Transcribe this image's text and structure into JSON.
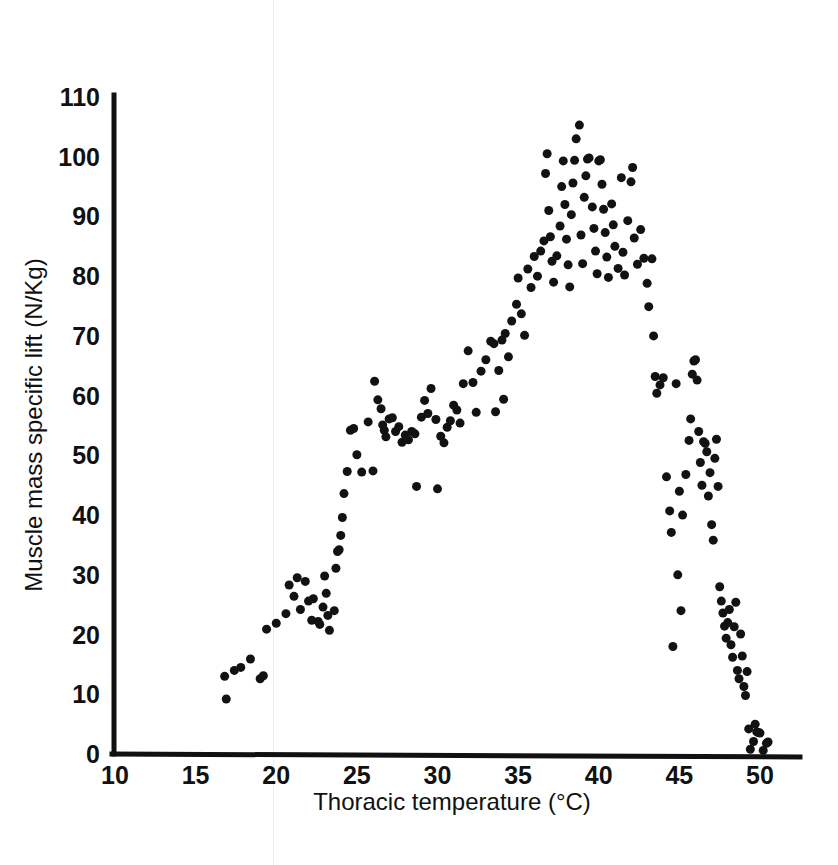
{
  "chart_data": {
    "type": "scatter",
    "title": "",
    "xlabel": "Thoracic temperature (°C)",
    "ylabel": "Muscle mass specific lift (N/Kg)",
    "xlim": [
      10,
      51.5
    ],
    "ylim": [
      0,
      110
    ],
    "xticks": [
      10,
      15,
      20,
      25,
      30,
      35,
      40,
      45,
      50
    ],
    "yticks": [
      0,
      10,
      20,
      30,
      40,
      50,
      60,
      70,
      80,
      90,
      100,
      110
    ],
    "xtick_labels": [
      "10",
      "15",
      "20",
      "25",
      "30",
      "35",
      "40",
      "45",
      "50"
    ],
    "ytick_labels": [
      "0",
      "10",
      "20",
      "30",
      "40",
      "50",
      "60",
      "70",
      "80",
      "90",
      "100",
      "110"
    ],
    "grid": false,
    "legend": null,
    "marker": {
      "shape": "circle",
      "color": "#121212",
      "size_px": 9
    },
    "series": [
      {
        "name": "Muscle mass specific lift vs thoracic temperature",
        "points": [
          [
            16.8,
            13.0
          ],
          [
            16.9,
            9.2
          ],
          [
            17.4,
            14.0
          ],
          [
            17.8,
            14.5
          ],
          [
            18.4,
            15.9
          ],
          [
            19.0,
            12.6
          ],
          [
            19.2,
            13.1
          ],
          [
            19.4,
            20.9
          ],
          [
            20.0,
            21.9
          ],
          [
            20.6,
            23.5
          ],
          [
            20.8,
            28.3
          ],
          [
            21.1,
            26.4
          ],
          [
            21.3,
            29.5
          ],
          [
            21.5,
            24.2
          ],
          [
            21.8,
            28.9
          ],
          [
            22.0,
            25.6
          ],
          [
            22.2,
            22.4
          ],
          [
            22.3,
            26.0
          ],
          [
            22.6,
            22.2
          ],
          [
            22.7,
            21.7
          ],
          [
            22.9,
            24.6
          ],
          [
            23.0,
            29.8
          ],
          [
            23.1,
            26.9
          ],
          [
            23.2,
            23.2
          ],
          [
            23.3,
            20.7
          ],
          [
            23.6,
            24.0
          ],
          [
            23.7,
            31.1
          ],
          [
            23.8,
            33.9
          ],
          [
            23.9,
            34.2
          ],
          [
            24.0,
            36.6
          ],
          [
            24.1,
            39.6
          ],
          [
            24.2,
            43.6
          ],
          [
            24.4,
            47.3
          ],
          [
            24.6,
            54.2
          ],
          [
            24.8,
            54.5
          ],
          [
            25.3,
            47.2
          ],
          [
            25.7,
            55.6
          ],
          [
            26.1,
            62.4
          ],
          [
            26.3,
            59.3
          ],
          [
            26.5,
            57.8
          ],
          [
            26.6,
            55.1
          ],
          [
            26.7,
            54.2
          ],
          [
            26.8,
            53.1
          ],
          [
            27.0,
            56.1
          ],
          [
            27.2,
            56.3
          ],
          [
            27.4,
            54.0
          ],
          [
            27.6,
            54.8
          ],
          [
            27.8,
            52.2
          ],
          [
            28.0,
            53.4
          ],
          [
            28.2,
            52.6
          ],
          [
            28.4,
            54.0
          ],
          [
            28.6,
            53.6
          ],
          [
            28.7,
            44.8
          ],
          [
            29.0,
            56.4
          ],
          [
            29.2,
            59.2
          ],
          [
            29.4,
            57.0
          ],
          [
            29.6,
            61.2
          ],
          [
            29.9,
            56.0
          ],
          [
            30.2,
            53.2
          ],
          [
            30.4,
            52.1
          ],
          [
            30.6,
            54.7
          ],
          [
            30.8,
            55.8
          ],
          [
            31.0,
            58.4
          ],
          [
            31.2,
            57.6
          ],
          [
            31.4,
            55.4
          ],
          [
            31.6,
            62.0
          ],
          [
            31.9,
            67.5
          ],
          [
            32.2,
            62.2
          ],
          [
            32.4,
            57.2
          ],
          [
            32.7,
            64.1
          ],
          [
            33.0,
            66.0
          ],
          [
            33.3,
            69.1
          ],
          [
            33.5,
            68.7
          ],
          [
            33.6,
            57.3
          ],
          [
            33.8,
            64.2
          ],
          [
            34.0,
            69.3
          ],
          [
            34.2,
            70.4
          ],
          [
            34.4,
            66.5
          ],
          [
            34.6,
            72.5
          ],
          [
            34.9,
            75.3
          ],
          [
            35.0,
            79.7
          ],
          [
            35.2,
            73.7
          ],
          [
            35.4,
            70.1
          ],
          [
            35.6,
            81.2
          ],
          [
            35.8,
            78.1
          ],
          [
            36.0,
            83.3
          ],
          [
            36.2,
            80.0
          ],
          [
            36.4,
            84.2
          ],
          [
            36.6,
            85.9
          ],
          [
            36.7,
            97.2
          ],
          [
            36.8,
            100.5
          ],
          [
            36.9,
            91.0
          ],
          [
            37.0,
            86.6
          ],
          [
            37.1,
            82.5
          ],
          [
            37.2,
            79.0
          ],
          [
            37.4,
            83.4
          ],
          [
            37.6,
            88.4
          ],
          [
            37.7,
            95.0
          ],
          [
            37.8,
            99.3
          ],
          [
            37.9,
            92.0
          ],
          [
            38.0,
            86.2
          ],
          [
            38.1,
            81.9
          ],
          [
            38.2,
            78.2
          ],
          [
            38.3,
            90.3
          ],
          [
            38.4,
            95.6
          ],
          [
            38.5,
            99.4
          ],
          [
            38.6,
            103.0
          ],
          [
            38.8,
            105.3
          ],
          [
            38.9,
            86.9
          ],
          [
            39.0,
            82.1
          ],
          [
            39.1,
            93.2
          ],
          [
            39.2,
            96.8
          ],
          [
            39.3,
            99.6
          ],
          [
            39.4,
            99.8
          ],
          [
            39.6,
            91.6
          ],
          [
            39.7,
            88.0
          ],
          [
            39.8,
            84.2
          ],
          [
            39.9,
            80.4
          ],
          [
            40.0,
            99.3
          ],
          [
            40.1,
            99.5
          ],
          [
            40.2,
            95.4
          ],
          [
            40.3,
            91.2
          ],
          [
            40.4,
            87.3
          ],
          [
            40.5,
            83.2
          ],
          [
            40.6,
            79.8
          ],
          [
            40.8,
            92.1
          ],
          [
            40.9,
            88.6
          ],
          [
            41.0,
            85.0
          ],
          [
            41.2,
            81.3
          ],
          [
            41.4,
            96.5
          ],
          [
            41.5,
            84.0
          ],
          [
            41.6,
            80.2
          ],
          [
            41.8,
            89.3
          ],
          [
            42.0,
            95.8
          ],
          [
            42.1,
            98.2
          ],
          [
            42.2,
            86.4
          ],
          [
            42.4,
            82.0
          ],
          [
            42.6,
            87.8
          ],
          [
            42.8,
            83.0
          ],
          [
            43.0,
            78.8
          ],
          [
            43.1,
            74.9
          ],
          [
            43.3,
            82.9
          ],
          [
            43.5,
            63.2
          ],
          [
            43.6,
            60.4
          ],
          [
            43.8,
            61.8
          ],
          [
            44.0,
            63.0
          ],
          [
            44.2,
            46.4
          ],
          [
            44.4,
            40.7
          ],
          [
            44.5,
            37.1
          ],
          [
            44.6,
            18.0
          ],
          [
            44.8,
            62.0
          ],
          [
            45.0,
            44.0
          ],
          [
            45.2,
            40.0
          ],
          [
            45.4,
            46.8
          ],
          [
            45.6,
            52.5
          ],
          [
            45.7,
            56.1
          ],
          [
            45.8,
            63.6
          ],
          [
            45.9,
            65.8
          ],
          [
            46.0,
            66.0
          ],
          [
            46.1,
            62.6
          ],
          [
            46.2,
            54.0
          ],
          [
            46.3,
            48.8
          ],
          [
            46.4,
            45.0
          ],
          [
            46.5,
            52.3
          ],
          [
            46.6,
            52.0
          ],
          [
            46.7,
            50.6
          ],
          [
            46.8,
            43.2
          ],
          [
            46.9,
            47.1
          ],
          [
            47.0,
            38.4
          ],
          [
            47.1,
            35.8
          ],
          [
            47.2,
            49.5
          ],
          [
            47.3,
            52.7
          ],
          [
            47.4,
            44.8
          ],
          [
            47.5,
            28.0
          ],
          [
            47.6,
            25.6
          ],
          [
            47.7,
            23.6
          ],
          [
            47.8,
            21.4
          ],
          [
            47.9,
            19.4
          ],
          [
            48.0,
            22.0
          ],
          [
            48.1,
            24.2
          ],
          [
            48.2,
            18.3
          ],
          [
            48.3,
            16.2
          ],
          [
            48.4,
            21.3
          ],
          [
            48.5,
            25.4
          ],
          [
            48.6,
            14.0
          ],
          [
            48.7,
            12.6
          ],
          [
            48.8,
            20.1
          ],
          [
            48.9,
            16.4
          ],
          [
            49.0,
            11.3
          ],
          [
            49.1,
            9.8
          ],
          [
            49.2,
            13.8
          ],
          [
            49.3,
            4.2
          ],
          [
            49.4,
            0.8
          ],
          [
            49.6,
            2.1
          ],
          [
            49.7,
            5.0
          ],
          [
            49.8,
            3.7
          ],
          [
            49.9,
            3.6
          ],
          [
            50.0,
            3.5
          ],
          [
            50.2,
            0.6
          ],
          [
            50.4,
            1.8
          ],
          [
            50.5,
            2.0
          ],
          [
            44.9,
            30.0
          ],
          [
            45.1,
            24.0
          ],
          [
            43.4,
            70.0
          ],
          [
            34.1,
            59.4
          ],
          [
            30.0,
            44.4
          ],
          [
            25.0,
            50.1
          ],
          [
            26.0,
            47.4
          ]
        ]
      }
    ]
  }
}
